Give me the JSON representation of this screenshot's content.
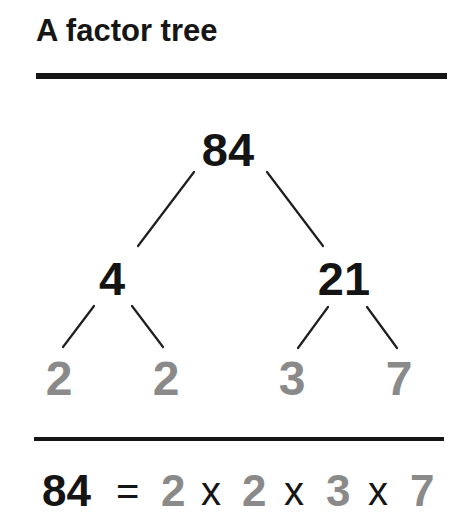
{
  "title": "A factor tree",
  "colors": {
    "composite": "#141414",
    "prime": "#8a8a8a",
    "rule": "#151515"
  },
  "tree": {
    "root": {
      "value": "84",
      "type": "composite"
    },
    "level1": [
      {
        "value": "4",
        "type": "composite",
        "parent": "84"
      },
      {
        "value": "21",
        "type": "composite",
        "parent": "84"
      }
    ],
    "leaves": [
      {
        "value": "2",
        "type": "prime",
        "parent": "4"
      },
      {
        "value": "2",
        "type": "prime",
        "parent": "4"
      },
      {
        "value": "3",
        "type": "prime",
        "parent": "21"
      },
      {
        "value": "7",
        "type": "prime",
        "parent": "21"
      }
    ]
  },
  "equation": {
    "lhs": "84",
    "equals": "=",
    "factors": [
      "2",
      "2",
      "3",
      "7"
    ],
    "times": "x"
  }
}
